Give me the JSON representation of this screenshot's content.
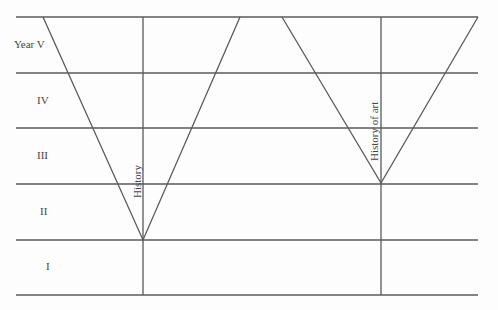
{
  "diagram": {
    "row_labels": [
      {
        "label": "Year  V",
        "y": 45,
        "x": 14
      },
      {
        "label": "IV",
        "y": 100,
        "x": 37
      },
      {
        "label": "III",
        "y": 156,
        "x": 37
      },
      {
        "label": "II",
        "y": 212,
        "x": 40
      },
      {
        "label": "I",
        "y": 267,
        "x": 47
      }
    ],
    "subjects": [
      {
        "label": "History",
        "vertex_year": "I/II boundary"
      },
      {
        "label": "History of art",
        "vertex_year": "II/III boundary"
      }
    ],
    "line_color": "#555555"
  }
}
